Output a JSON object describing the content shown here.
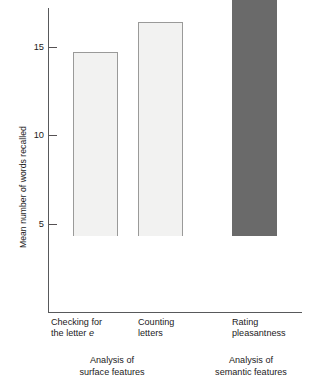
{
  "chart_data": {
    "type": "bar",
    "title": "",
    "subtitle": "",
    "xlabel": "",
    "ylabel": "Mean number of words recalled",
    "categories": [
      "Checking for the letter e",
      "Counting letters",
      "Rating pleasantness"
    ],
    "values": [
      10.4,
      12.1,
      16.6
    ],
    "ylim": [
      0,
      17.2
    ],
    "yticks": [
      5,
      10,
      15
    ],
    "ytick_labels": [
      "5",
      "10",
      "15"
    ],
    "grid": false,
    "legend": null,
    "series": [
      {
        "name": "Mean number of words recalled",
        "values": [
          10.4,
          12.1,
          16.6
        ]
      }
    ],
    "bar_styles": [
      "open",
      "open",
      "filled"
    ],
    "annotations": [
      "Analysis of surface features",
      "Analysis of semantic features"
    ],
    "colors": {
      "bar_open_fill": "#f2f2f1",
      "bar_open_border": "#9a9a99",
      "bar_filled_fill": "#6a6a6a",
      "axis": "#58595b",
      "text": "#1c1a1b",
      "background": "#ffffff"
    }
  },
  "axis": {
    "y_label": "Mean number of words recalled",
    "ticks": [
      {
        "value": "15"
      },
      {
        "value": "10"
      },
      {
        "value": "5"
      }
    ]
  },
  "categories": [
    {
      "line1": "Checking for",
      "line2_pre": "the letter ",
      "line2_italic": "e"
    },
    {
      "line1": "Counting",
      "line2_pre": "letters",
      "line2_italic": ""
    },
    {
      "line1": "Rating",
      "line2_pre": "pleasantness",
      "line2_italic": ""
    }
  ],
  "groups": [
    {
      "line1": "Analysis of",
      "line2": "surface features"
    },
    {
      "line1": "Analysis of",
      "line2": "semantic features"
    }
  ]
}
